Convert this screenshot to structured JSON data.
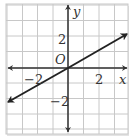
{
  "chart_data": {
    "type": "line",
    "title": "",
    "xlabel": "x",
    "ylabel": "y",
    "origin_label": "O",
    "xlim": [
      -4,
      4
    ],
    "ylim": [
      -4,
      4
    ],
    "grid": true,
    "x_tick_labels": [
      {
        "value": -2,
        "label": "−2"
      },
      {
        "value": 2,
        "label": "2"
      }
    ],
    "y_tick_labels": [
      {
        "value": 2,
        "label": "2"
      },
      {
        "value": -2,
        "label": "−2"
      }
    ],
    "series": [
      {
        "name": "line",
        "equation": "y = x/2",
        "slope": 0.5,
        "intercept": 0,
        "x": [
          -4,
          4
        ],
        "y": [
          -2,
          2
        ],
        "arrows": "both"
      }
    ]
  },
  "colors": {
    "grid": "#c8c8c8",
    "axis": "#333333",
    "line": "#222222",
    "border": "#bdbdbd"
  },
  "labels": {
    "x_axis": "x",
    "y_axis": "y",
    "origin": "O",
    "x_neg2": "−2",
    "x_pos2": "2",
    "y_pos2": "2",
    "y_neg2": "−2"
  }
}
